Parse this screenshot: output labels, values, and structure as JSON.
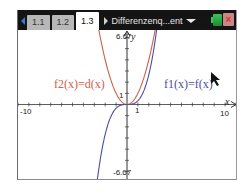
{
  "topbar": {
    "tabs": [
      {
        "label": "1.1",
        "active": false
      },
      {
        "label": "1.2",
        "active": false
      },
      {
        "label": "1.3",
        "active": true
      }
    ],
    "document_title": "Differenzenq...ent",
    "close_glyph": "×"
  },
  "graph": {
    "window": {
      "xmin": -10,
      "xmax": 10,
      "ymin": -6.67,
      "ymax": 6.67
    },
    "labels": {
      "ymax": "6.67",
      "ymin": "-6.67",
      "xmin": "-10",
      "xmax": "10",
      "x_unit": "1",
      "y_unit": "1",
      "x_axis": "x",
      "y_axis": "y"
    },
    "functions": [
      {
        "name": "f1",
        "label": "f1(x)=f(x)",
        "expr": "x^3/3",
        "color": "#4a4fa0"
      },
      {
        "name": "f2",
        "label": "f2(x)=d(x)",
        "expr": "x^2",
        "color": "#d0604a"
      }
    ]
  },
  "colors": {
    "topbar_bg": "#141414",
    "tab_inactive": "#b8b8b8",
    "tab_active": "#ffffff",
    "axis": "#333333"
  }
}
